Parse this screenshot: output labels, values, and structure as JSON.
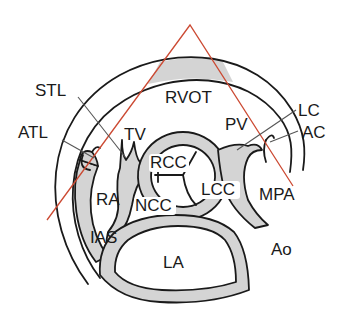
{
  "figure": {
    "colors": {
      "outline": "#1a1a1a",
      "wall_fill": "#d4d4d4",
      "scan_sector": "#cc4a33",
      "leader_line": "#555555",
      "background": "#ffffff"
    }
  },
  "labels": {
    "rvot": "RVOT",
    "stl": "STL",
    "atl": "ATL",
    "tv": "TV",
    "pv": "PV",
    "lc": "LC",
    "ac": "AC",
    "rcc": "RCC",
    "lcc": "LCC",
    "ra": "RA",
    "ncc": "NCC",
    "mpa": "MPA",
    "ias": "IAS",
    "la": "LA",
    "ao": "Ao"
  }
}
